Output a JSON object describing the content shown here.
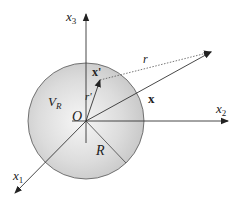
{
  "diagram": {
    "colors": {
      "sphere_fill_center": "#f4f4f4",
      "sphere_fill_edge": "#c8c8c8",
      "sphere_stroke": "#555555",
      "axis": "#333333",
      "text": "#222222"
    },
    "labels": {
      "x3_base": "x",
      "x3_sub": "3",
      "x2_base": "x",
      "x2_sub": "2",
      "x1_base": "x",
      "x1_sub": "1",
      "origin": "O",
      "volume_base": "V",
      "volume_sub": "R",
      "radius": "R",
      "field_vector": "x",
      "source_vector": "x'",
      "source_magnitude": "r'",
      "separation": "r"
    },
    "nodes": [
      {
        "id": "origin",
        "label": "O",
        "x": 86,
        "y": 121
      },
      {
        "id": "source-point",
        "label": "x'",
        "x": 100,
        "y": 80
      },
      {
        "id": "field-point",
        "label": "x",
        "x": 211,
        "y": 52
      }
    ],
    "edges": [
      {
        "from": "origin",
        "to": "field-point",
        "style": "solid-arrow",
        "label": "x"
      },
      {
        "from": "origin",
        "to": "source-point",
        "style": "solid-arrow",
        "label": "r'"
      },
      {
        "from": "source-point",
        "to": "field-point",
        "style": "dotted-arrow",
        "label": "r"
      },
      {
        "from": "origin",
        "to": "sphere-surface",
        "style": "line",
        "label": "R"
      }
    ]
  }
}
